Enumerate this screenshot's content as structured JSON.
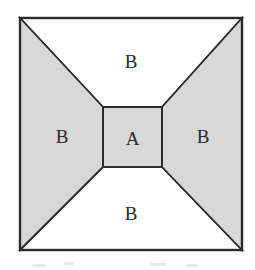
{
  "figure": {
    "labels": {
      "center": "A",
      "top": "B",
      "left": "B",
      "right": "B",
      "bottom": "B"
    },
    "colors": {
      "shaded": "#d8d8d8",
      "unshaded": "#ffffff",
      "line": "#2b2b2b"
    }
  }
}
